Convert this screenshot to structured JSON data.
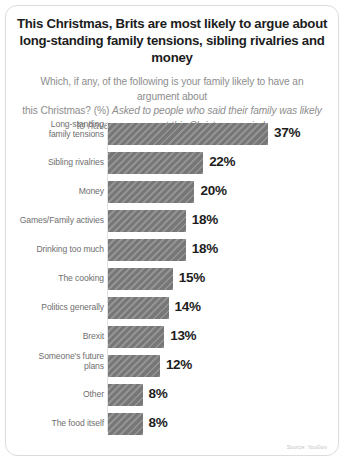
{
  "card": {
    "title_lines": [
      "This Christmas, Brits are most likely to argue about",
      "long-standing family tensions, sibling rivalries and money"
    ],
    "subtitle_lines": [
      "Which, if any, of the following is your family likely to have an argument about",
      "this Christmas? (%) ",
      "Asked to people who said their family was likely",
      "to have an argument this Christmas period."
    ],
    "source": "Source: YouGov"
  },
  "chart_data": {
    "type": "bar",
    "orientation": "horizontal",
    "title": "This Christmas, Brits are most likely to argue about long-standing family tensions, sibling rivalries and money",
    "subtitle": "Which, if any, of the following is your family likely to have an argument about this Christmas? (%) Asked to people who said their family was likely to have an argument this Christmas period.",
    "xlabel": "",
    "ylabel": "",
    "xlim": [
      0,
      37
    ],
    "grid": false,
    "legend": false,
    "value_suffix": "%",
    "bar_color": "#7e7e7e",
    "categories": [
      "Long-standing family tensions",
      "Sibling rivalries",
      "Money",
      "Games/Family activies",
      "Drinking too much",
      "The cooking",
      "Politics generally",
      "Brexit",
      "Someone's future plans",
      "Other",
      "The food itself"
    ],
    "values": [
      37,
      22,
      20,
      18,
      18,
      15,
      14,
      13,
      12,
      8,
      8
    ],
    "value_labels": [
      "37%",
      "22%",
      "20%",
      "18%",
      "18%",
      "15%",
      "14%",
      "13%",
      "12%",
      "8%",
      "8%"
    ],
    "category_label_lines": [
      [
        "Long-standing",
        "family tensions"
      ],
      [
        "Sibling rivalries"
      ],
      [
        "Money"
      ],
      [
        "Games/Family activies"
      ],
      [
        "Drinking too much"
      ],
      [
        "The cooking"
      ],
      [
        "Politics generally"
      ],
      [
        "Brexit"
      ],
      [
        "Someone's future",
        "plans"
      ],
      [
        "Other"
      ],
      [
        "The food itself"
      ]
    ]
  }
}
